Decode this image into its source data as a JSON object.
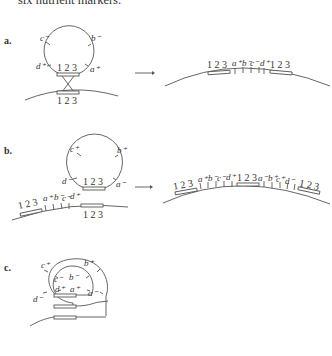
{
  "caption": "six nutrient markers.",
  "panels": {
    "a": {
      "label": "a.",
      "circle_markers": [
        "c⁻",
        "b⁻",
        "d⁺",
        "a⁺"
      ],
      "circle_genes": "1 2 3",
      "chromosome_genes": "1 2 3",
      "result_sequence": [
        "1 2 3",
        "a⁺",
        "b⁻",
        "c⁻",
        "d⁺",
        "1 2 3"
      ]
    },
    "b": {
      "label": "b.",
      "circle_markers": [
        "c⁺",
        "b⁺",
        "d⁻",
        "a⁻"
      ],
      "circle_genes": "1 2 3",
      "chromosome_left_genes": "1 2 3",
      "chromosome_markers": [
        "a⁺",
        "b⁻",
        "c⁻",
        "d⁺"
      ],
      "chromosome_right_genes": "1 2 3",
      "result_sequence": [
        "1 2 3",
        "a⁺",
        "b⁻",
        "c⁻",
        "d⁺",
        "1 2 3",
        "a⁻",
        "b⁺",
        "c⁺",
        "d⁻",
        "1 2 3"
      ]
    },
    "c": {
      "label": "c.",
      "outer_markers": [
        "c⁺",
        "b⁺",
        "d⁻",
        "a⁻"
      ],
      "inner_markers": [
        "c⁻",
        "b⁻",
        "d⁺",
        "a⁺"
      ]
    }
  }
}
